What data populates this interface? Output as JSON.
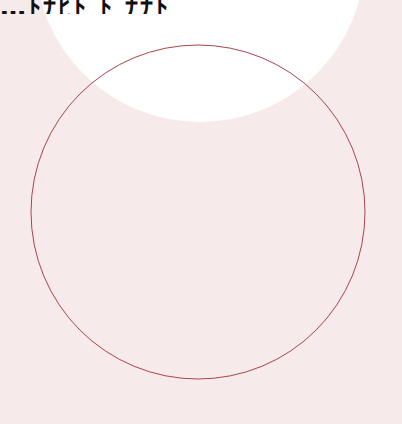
{
  "scene": {
    "background_color": "#f6eaeb",
    "top_text_fragment": "…ﾄﾅﾋﾄ          ﾄ ﾅﾅﾄ",
    "white_shape": {
      "cx": 200,
      "cy": -43,
      "r": 165,
      "color": "#ffffff"
    },
    "outline_circle": {
      "cx": 198,
      "cy": 212,
      "r": 167,
      "stroke": "#a8454c",
      "stroke_width": 1
    }
  }
}
